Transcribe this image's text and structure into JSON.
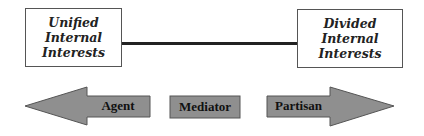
{
  "diagram": {
    "left_box": {
      "lines": [
        "Unified",
        "Internal",
        "Interests"
      ]
    },
    "right_box": {
      "lines": [
        "Divided",
        "Internal",
        "Interests"
      ]
    },
    "spectrum": {
      "left_arrow_label": "Agent",
      "center_label": "Mediator",
      "right_arrow_label": "Partisan"
    },
    "colors": {
      "arrow_fill": "#8f8f8f",
      "arrow_stroke": "#555555",
      "line": "#222222"
    }
  }
}
